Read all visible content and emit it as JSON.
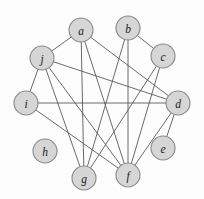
{
  "figure": {
    "background_color": "#fdfdfd"
  },
  "style": {
    "node_fill": "#d6d6d6",
    "node_stroke": "#8a8a8a",
    "edge_color": "#595959",
    "label_color": "#1a1a1a",
    "node_radius": 12
  },
  "chart_data": {
    "type": "diagram",
    "graph_type": "undirected",
    "node_count": 10,
    "edge_count": 17,
    "nodes": [
      {
        "id": "a",
        "label": "a",
        "x": 81,
        "y": 30,
        "degree": 4
      },
      {
        "id": "b",
        "label": "b",
        "x": 128,
        "y": 28,
        "degree": 3
      },
      {
        "id": "c",
        "label": "c",
        "x": 163,
        "y": 56,
        "degree": 2
      },
      {
        "id": "d",
        "label": "d",
        "x": 178,
        "y": 103,
        "degree": 5
      },
      {
        "id": "e",
        "label": "e",
        "x": 163,
        "y": 148,
        "degree": 1
      },
      {
        "id": "f",
        "label": "f",
        "x": 128,
        "y": 175,
        "degree": 6
      },
      {
        "id": "g",
        "label": "g",
        "x": 84,
        "y": 178,
        "degree": 3
      },
      {
        "id": "h",
        "label": "h",
        "x": 45,
        "y": 151,
        "degree": 0
      },
      {
        "id": "i",
        "label": "i",
        "x": 26,
        "y": 103,
        "degree": 3
      },
      {
        "id": "j",
        "label": "j",
        "x": 42,
        "y": 58,
        "degree": 5
      }
    ],
    "edges": [
      {
        "source": "a",
        "target": "j"
      },
      {
        "source": "a",
        "target": "d"
      },
      {
        "source": "a",
        "target": "g"
      },
      {
        "source": "a",
        "target": "f"
      },
      {
        "source": "b",
        "target": "c"
      },
      {
        "source": "b",
        "target": "g"
      },
      {
        "source": "b",
        "target": "f"
      },
      {
        "source": "c",
        "target": "f"
      },
      {
        "source": "d",
        "target": "i"
      },
      {
        "source": "d",
        "target": "j"
      },
      {
        "source": "d",
        "target": "e"
      },
      {
        "source": "d",
        "target": "f"
      },
      {
        "source": "i",
        "target": "j"
      },
      {
        "source": "i",
        "target": "f"
      },
      {
        "source": "j",
        "target": "g"
      },
      {
        "source": "j",
        "target": "f"
      },
      {
        "source": "c",
        "target": "g"
      }
    ],
    "isolated_nodes": [
      "h"
    ],
    "xlim": [
      0,
      204
    ],
    "ylim": [
      0,
      199
    ]
  }
}
